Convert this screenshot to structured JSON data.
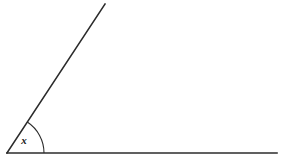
{
  "figure": {
    "background_color": "#ffffff",
    "stroke_color": "#2b2b2b",
    "arc_color": "#2b2b2b",
    "label_color": "#1a1a1a",
    "width": 281,
    "height": 164,
    "angle_label": "x",
    "vertex": {
      "x": 7,
      "y": 153
    },
    "rays": [
      {
        "name": "horizontal-ray",
        "from": {
          "x": 7,
          "y": 153
        },
        "to": {
          "x": 277,
          "y": 153
        },
        "stroke_width": 1.6
      },
      {
        "name": "diagonal-ray",
        "from": {
          "x": 7,
          "y": 153
        },
        "to": {
          "x": 105,
          "y": 4
        },
        "stroke_width": 1.6
      }
    ],
    "arc": {
      "radius": 37,
      "start": {
        "x": 44,
        "y": 153
      },
      "end": {
        "x": 27.3,
        "y": 122
      },
      "stroke_width": 1.1,
      "measure_degrees": 56.7
    }
  },
  "chart_data": {
    "type": "diagram",
    "title": "",
    "shapes": [
      {
        "kind": "ray",
        "label": "horizontal-ray",
        "points": [
          [
            7,
            153
          ],
          [
            277,
            153
          ]
        ]
      },
      {
        "kind": "ray",
        "label": "diagonal-ray",
        "points": [
          [
            7,
            153
          ],
          [
            105,
            4
          ]
        ]
      },
      {
        "kind": "arc",
        "label": "angle-arc",
        "center": [
          7,
          153
        ],
        "radius": 37,
        "start_angle_degrees": 0,
        "end_angle_degrees": 56.7
      }
    ],
    "annotations": [
      {
        "text": "x",
        "position": [
          22,
          141
        ],
        "style": "bold-italic",
        "meaning": "unknown angle measure at vertex"
      }
    ]
  }
}
